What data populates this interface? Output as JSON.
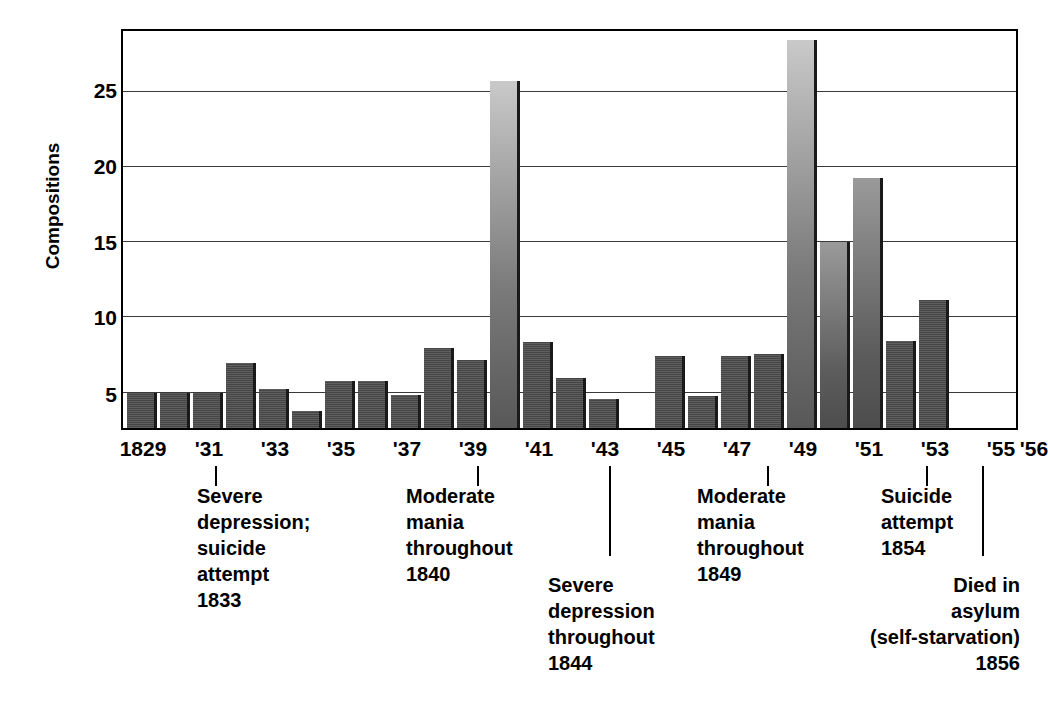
{
  "chart_data": {
    "type": "bar",
    "title": "",
    "xlabel": "",
    "ylabel": "Compositions",
    "ylim": [
      0,
      26.4
    ],
    "yticks": [
      5,
      10,
      15,
      20,
      25
    ],
    "grid": true,
    "legend": "none",
    "categories": [
      "1829",
      "1830",
      "1831",
      "1832",
      "1833",
      "1834",
      "1835",
      "1836",
      "1837",
      "1838",
      "1839",
      "1840",
      "1841",
      "1842",
      "1843",
      "1844",
      "1845",
      "1846",
      "1847",
      "1848",
      "1849",
      "1850",
      "1851",
      "1852",
      "1853",
      "1854",
      "1855",
      "1856"
    ],
    "values": [
      2.3,
      2.3,
      2.3,
      4.3,
      2.6,
      1.1,
      3.1,
      3.1,
      2.2,
      5.3,
      4.5,
      23.1,
      5.7,
      3.3,
      1.9,
      0,
      4.8,
      2.1,
      4.8,
      4.9,
      25.8,
      12.4,
      16.6,
      5.8,
      8.5,
      0,
      0,
      0
    ],
    "tick_labels": [
      "1829",
      "'31",
      "'33",
      "'35",
      "'37",
      "'39",
      "'41",
      "'43",
      "'45",
      "'47",
      "'49",
      "'51",
      "'53",
      "'55",
      "'56"
    ],
    "tick_years": [
      1829,
      1831,
      1833,
      1835,
      1837,
      1839,
      1841,
      1843,
      1845,
      1847,
      1849,
      1851,
      1853,
      1855,
      1856
    ],
    "annotations": [
      {
        "id": "a1833",
        "year": 1833,
        "text": "Severe\ndepression;\nsuicide\nattempt\n1833"
      },
      {
        "id": "a1840",
        "year": 1840,
        "text": "Moderate\nmania\nthroughout\n1840"
      },
      {
        "id": "a1844",
        "year": 1844,
        "text": "Severe\ndepression\nthroughout\n1844"
      },
      {
        "id": "a1849",
        "year": 1849,
        "text": "Moderate\nmania\nthroughout\n1849"
      },
      {
        "id": "a1854",
        "year": 1854,
        "text": "Suicide\nattempt\n1854"
      },
      {
        "id": "a1856",
        "year": 1856,
        "text": "Died in\nasylum\n(self-starvation)\n1856"
      }
    ],
    "colors": {
      "bar": "#4d4d4d",
      "bar_highlight": "#8c8c8c",
      "bar_shadow": "#1a1a1a",
      "axis": "#000000",
      "grid": "#3a3a3a",
      "background": "#ffffff",
      "text": "#000000"
    }
  },
  "axis": {
    "y_title": "Compositions",
    "yticks": [
      "5",
      "10",
      "15",
      "20",
      "25"
    ]
  }
}
